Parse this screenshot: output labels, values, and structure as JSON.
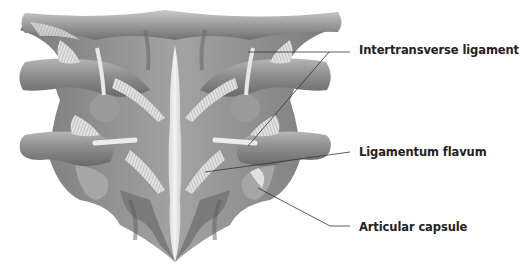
{
  "figure": {
    "labels": [
      {
        "id": "intertransverse",
        "text": "Intertransverse ligament"
      },
      {
        "id": "flavum",
        "text": "Ligamentum flavum"
      },
      {
        "id": "capsule",
        "text": "Articular capsule"
      }
    ],
    "colors": {
      "bone": "#8f8f8f",
      "bone_light": "#c4c4c4",
      "bone_dark": "#5e5e5e",
      "ligament": "#e6e6e6",
      "leader_line": "#333333",
      "label_text": "#222222",
      "background": "#ffffff"
    }
  }
}
